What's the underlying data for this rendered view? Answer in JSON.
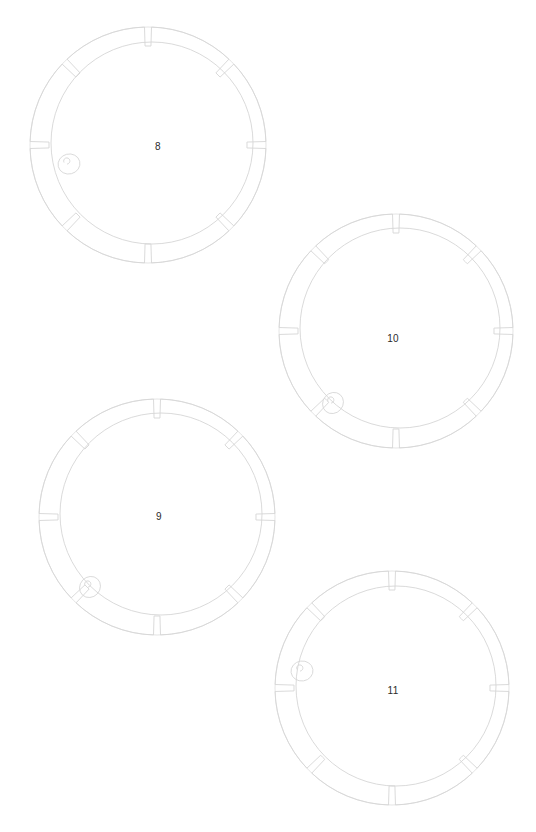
{
  "document": {
    "kind": "technical-line-drawing-sheet",
    "background_color": "#ffffff",
    "line_color": "#d6d6d6",
    "label_color": "#2b2b2b",
    "width": 536,
    "height": 832
  },
  "parts": [
    {
      "label": "8",
      "label_x": 158,
      "label_y": 147,
      "outer": {
        "cx": 148,
        "cy": 145,
        "r": 118
      },
      "inner": {
        "cx": 152,
        "cy": 143,
        "r": 101
      },
      "notch_count": 8,
      "notch_start_angle": -90,
      "notch_width_deg": 3.4,
      "tab": {
        "cx": 69,
        "cy": 164,
        "rx": 11,
        "ry": 10,
        "angle_deg": 166
      }
    },
    {
      "label": "9",
      "label_x": 159,
      "label_y": 517,
      "outer": {
        "cx": 157,
        "cy": 517,
        "r": 118
      },
      "inner": {
        "cx": 161,
        "cy": 514,
        "r": 101
      },
      "notch_count": 8,
      "notch_start_angle": -90,
      "notch_width_deg": 3.4,
      "tab": {
        "cx": 90,
        "cy": 587,
        "rx": 11,
        "ry": 10,
        "angle_deg": 133
      }
    },
    {
      "label": "10",
      "label_x": 393,
      "label_y": 339,
      "outer": {
        "cx": 396,
        "cy": 331,
        "r": 117
      },
      "inner": {
        "cx": 400,
        "cy": 328,
        "r": 100
      },
      "notch_count": 8,
      "notch_start_angle": -90,
      "notch_width_deg": 3.4,
      "tab": {
        "cx": 333,
        "cy": 403,
        "rx": 11,
        "ry": 10,
        "angle_deg": 131
      }
    },
    {
      "label": "11",
      "label_x": 393,
      "label_y": 691,
      "outer": {
        "cx": 392,
        "cy": 688,
        "r": 117
      },
      "inner": {
        "cx": 396,
        "cy": 686,
        "r": 100
      },
      "notch_count": 8,
      "notch_start_angle": -90,
      "notch_width_deg": 3.4,
      "tab": {
        "cx": 302,
        "cy": 671,
        "rx": 11,
        "ry": 10,
        "angle_deg": 172
      }
    }
  ]
}
